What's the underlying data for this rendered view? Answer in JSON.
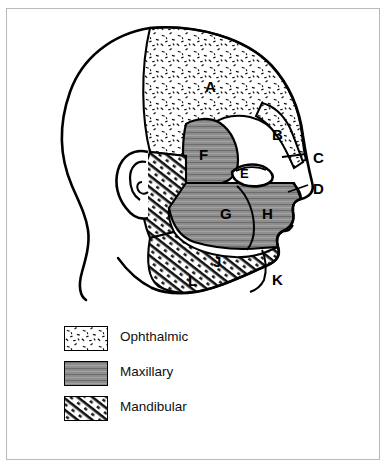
{
  "figure": {
    "border_color": "#b9b9b9",
    "ink_color": "#000000"
  },
  "region_labels": [
    {
      "id": "A",
      "text": "A",
      "x": 205,
      "y": 79,
      "size": 15,
      "division": "Ophthalmic",
      "area": "forehead-scalp"
    },
    {
      "id": "B",
      "text": "B",
      "x": 272,
      "y": 127,
      "size": 15,
      "division": "Ophthalmic",
      "area": "lateral-temple"
    },
    {
      "id": "C",
      "text": "C",
      "x": 313,
      "y": 150,
      "size": 15,
      "division": "Ophthalmic",
      "area": "nasal-bridge"
    },
    {
      "id": "D",
      "text": "D",
      "x": 313,
      "y": 181,
      "size": 15,
      "division": "Maxillary",
      "area": "nasal-tip"
    },
    {
      "id": "E",
      "text": "E",
      "x": 240,
      "y": 167,
      "size": 13,
      "division": "Ophthalmic",
      "area": "medial-canthus"
    },
    {
      "id": "F",
      "text": "F",
      "x": 199,
      "y": 147,
      "size": 15,
      "division": "Maxillary",
      "area": "upper-cheek-temporal"
    },
    {
      "id": "G",
      "text": "G",
      "x": 220,
      "y": 206,
      "size": 15,
      "division": "Maxillary",
      "area": "posterior-cheek"
    },
    {
      "id": "H",
      "text": "H",
      "x": 262,
      "y": 206,
      "size": 15,
      "division": "Maxillary",
      "area": "anterior-cheek"
    },
    {
      "id": "J",
      "text": "J",
      "x": 213,
      "y": 254,
      "size": 15,
      "division": "Mandibular",
      "area": "mandible-body"
    },
    {
      "id": "K",
      "text": "K",
      "x": 272,
      "y": 272,
      "size": 15,
      "division": "Mandibular",
      "area": "chin"
    },
    {
      "id": "L",
      "text": "L",
      "x": 188,
      "y": 273,
      "size": 15,
      "division": "Mandibular",
      "area": "angle-of-jaw"
    }
  ],
  "legend": {
    "rows": [
      {
        "key": "ophthalmic",
        "label": "Ophthalmic",
        "pattern": "stipple",
        "x": 64,
        "y": 326
      },
      {
        "key": "maxillary",
        "label": "Maxillary",
        "pattern": "gray-lines",
        "x": 64,
        "y": 361
      },
      {
        "key": "mandibular",
        "label": "Mandibular",
        "pattern": "hatch",
        "x": 64,
        "y": 396
      }
    ]
  }
}
